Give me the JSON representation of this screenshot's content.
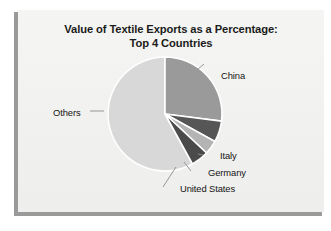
{
  "page": {
    "title_line1": "Value of Textile Exports as a Percentage:",
    "title_line2": "Top 4 Countries",
    "background_color": "#f3f3f1",
    "frame_color": "#9a9a9a"
  },
  "chart_data": {
    "type": "pie",
    "title": "Value of Textile Exports as a Percentage: Top 4 Countries",
    "subtitle": "",
    "xlabel": "",
    "ylabel": "",
    "labels": [
      "China",
      "Italy",
      "Germany",
      "United States",
      "Others"
    ],
    "values": [
      27,
      6,
      4,
      5,
      58
    ],
    "units": "percent",
    "legend": "none",
    "labels_position": "callout-leader-lines",
    "start_angle_deg": 0,
    "direction": "clockwise",
    "colors": [
      "#9a9a9a",
      "#565656",
      "#b4b4b4",
      "#4a4a4a",
      "#d8d8d8"
    ],
    "slice_border_color": "#ffffff",
    "slices": [
      {
        "name": "China",
        "value": 27,
        "color": "#9a9a9a",
        "label": "China"
      },
      {
        "name": "Italy",
        "value": 6,
        "color": "#565656",
        "label": "Italy"
      },
      {
        "name": "Germany",
        "value": 4,
        "color": "#b4b4b4",
        "label": "Germany"
      },
      {
        "name": "United States",
        "value": 5,
        "color": "#4a4a4a",
        "label": "United States"
      },
      {
        "name": "Others",
        "value": 58,
        "color": "#d8d8d8",
        "label": "Others"
      }
    ]
  }
}
